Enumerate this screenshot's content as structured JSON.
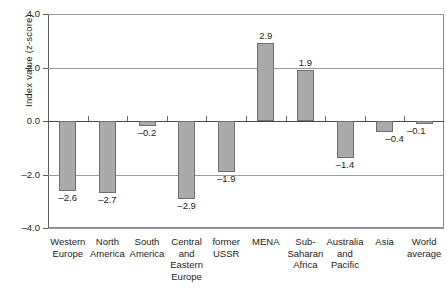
{
  "chart_data": {
    "type": "bar",
    "title": "",
    "xlabel": "",
    "ylabel": "Index value (z-score)",
    "ylim": [
      -4.0,
      4.0
    ],
    "grid": true,
    "legend": "none",
    "orientation": "vertical",
    "categories": [
      "Western Europe",
      "North America",
      "South America",
      "Central and Eastern Europe",
      "former USSR",
      "MENA",
      "Sub-Saharan Africa",
      "Australia and Pacific",
      "Asia",
      "World average"
    ],
    "category_lines": [
      [
        "Western",
        "Europe"
      ],
      [
        "North",
        "America"
      ],
      [
        "South",
        "America"
      ],
      [
        "Central",
        "and",
        "Eastern",
        "Europe"
      ],
      [
        "former",
        "USSR"
      ],
      [
        "MENA"
      ],
      [
        "Sub-",
        "Saharan",
        "Africa"
      ],
      [
        "Australia",
        "and",
        "Pacific"
      ],
      [
        "Asia"
      ],
      [
        "World",
        "average"
      ]
    ],
    "values": [
      -2.6,
      -2.7,
      -0.2,
      -2.9,
      -1.9,
      2.9,
      1.9,
      -1.4,
      -0.4,
      -0.1
    ],
    "value_labels": [
      "–2.6",
      "–2.7",
      "–0.2",
      "–2.9",
      "–1.9",
      "2.9",
      "1.9",
      "–1.4",
      "–0.4",
      "–0.1"
    ],
    "y_ticks": [
      4.0,
      2.0,
      0.0,
      -2.0,
      -4.0
    ],
    "y_tick_labels": [
      "4.0",
      "2.0",
      "0.0",
      "–2.0",
      "–4.0"
    ],
    "bar_fill_color": "#aaaaaa",
    "bar_border_color": "#6f6f6f",
    "axis_color": "#5d5d5d",
    "gridline_color": "#9a9a9a",
    "text_color": "#1c1c1c"
  }
}
